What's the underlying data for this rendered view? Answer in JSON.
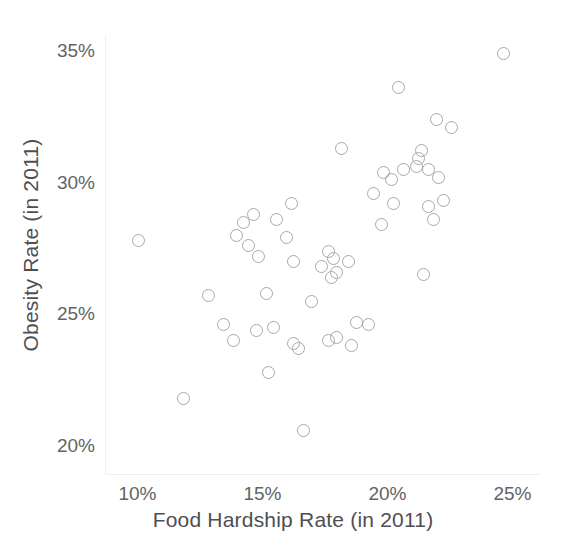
{
  "chart_data": {
    "type": "scatter",
    "title": "",
    "xlabel": "Food Hardship Rate (in 2011)",
    "ylabel": "Obesity Rate (in 2011)",
    "xlim": [
      8.7,
      26.1
    ],
    "ylim": [
      18.9,
      35.6
    ],
    "grid": false,
    "legend": null,
    "xticks": [
      {
        "value": 10,
        "label": "10%"
      },
      {
        "value": 15,
        "label": "15%"
      },
      {
        "value": 20,
        "label": "20%"
      },
      {
        "value": 25,
        "label": "25%"
      }
    ],
    "yticks": [
      {
        "value": 20,
        "label": "20%"
      },
      {
        "value": 25,
        "label": "25%"
      },
      {
        "value": 30,
        "label": "30%"
      },
      {
        "value": 35,
        "label": "35%"
      }
    ],
    "marker": {
      "shape": "circle-open",
      "edge_color": "#a8a8a8",
      "fill": "none",
      "size_px": 13
    },
    "points": [
      {
        "x": 10.0,
        "y": 27.8
      },
      {
        "x": 11.8,
        "y": 21.8
      },
      {
        "x": 12.8,
        "y": 25.7
      },
      {
        "x": 13.4,
        "y": 24.6
      },
      {
        "x": 13.8,
        "y": 24.0
      },
      {
        "x": 13.9,
        "y": 28.0
      },
      {
        "x": 14.2,
        "y": 28.5
      },
      {
        "x": 14.4,
        "y": 27.6
      },
      {
        "x": 14.6,
        "y": 28.8
      },
      {
        "x": 14.7,
        "y": 24.4
      },
      {
        "x": 14.8,
        "y": 27.2
      },
      {
        "x": 15.1,
        "y": 25.8
      },
      {
        "x": 15.2,
        "y": 22.8
      },
      {
        "x": 15.4,
        "y": 24.5
      },
      {
        "x": 15.5,
        "y": 28.6
      },
      {
        "x": 15.9,
        "y": 27.9
      },
      {
        "x": 16.1,
        "y": 29.2
      },
      {
        "x": 16.2,
        "y": 23.9
      },
      {
        "x": 16.2,
        "y": 27.0
      },
      {
        "x": 16.4,
        "y": 23.7
      },
      {
        "x": 16.6,
        "y": 20.6
      },
      {
        "x": 16.9,
        "y": 25.5
      },
      {
        "x": 17.3,
        "y": 26.8
      },
      {
        "x": 17.6,
        "y": 24.0
      },
      {
        "x": 17.6,
        "y": 27.4
      },
      {
        "x": 17.7,
        "y": 26.4
      },
      {
        "x": 17.8,
        "y": 27.1
      },
      {
        "x": 17.9,
        "y": 24.1
      },
      {
        "x": 17.9,
        "y": 26.6
      },
      {
        "x": 18.1,
        "y": 31.3
      },
      {
        "x": 18.4,
        "y": 27.0
      },
      {
        "x": 18.5,
        "y": 23.8
      },
      {
        "x": 18.7,
        "y": 24.7
      },
      {
        "x": 19.2,
        "y": 24.6
      },
      {
        "x": 19.4,
        "y": 29.6
      },
      {
        "x": 19.7,
        "y": 28.4
      },
      {
        "x": 19.8,
        "y": 30.4
      },
      {
        "x": 20.1,
        "y": 30.1
      },
      {
        "x": 20.2,
        "y": 29.2
      },
      {
        "x": 20.4,
        "y": 33.6
      },
      {
        "x": 20.6,
        "y": 30.5
      },
      {
        "x": 21.1,
        "y": 30.6
      },
      {
        "x": 21.2,
        "y": 30.9
      },
      {
        "x": 21.3,
        "y": 31.2
      },
      {
        "x": 21.4,
        "y": 26.5
      },
      {
        "x": 21.6,
        "y": 30.5
      },
      {
        "x": 21.6,
        "y": 29.1
      },
      {
        "x": 21.8,
        "y": 28.6
      },
      {
        "x": 21.9,
        "y": 32.4
      },
      {
        "x": 22.0,
        "y": 30.2
      },
      {
        "x": 22.2,
        "y": 29.3
      },
      {
        "x": 22.5,
        "y": 32.1
      },
      {
        "x": 24.6,
        "y": 34.9
      }
    ]
  },
  "axis_titles": {
    "x": "Food Hardship Rate (in 2011)",
    "y": "Obesity Rate (in 2011)"
  }
}
